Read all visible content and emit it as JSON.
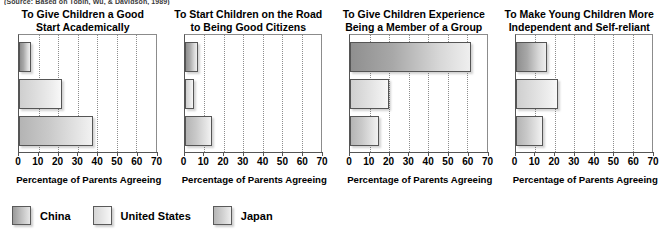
{
  "source_note": "(Source: Based on Tobin, Wu, & Davidson, 1989)",
  "legend": {
    "position": "bottom-left",
    "items": [
      {
        "label": "China",
        "key": "china"
      },
      {
        "label": "United States",
        "key": "us"
      },
      {
        "label": "Japan",
        "key": "japan"
      }
    ]
  },
  "axis": {
    "title": "Percentage of Parents Agreeing",
    "ticks": [
      0,
      10,
      20,
      30,
      40,
      50,
      60,
      70
    ],
    "min": 0,
    "max": 70
  },
  "chart_data": [
    {
      "type": "bar",
      "orientation": "horizontal",
      "title": "To Give Children a Good Start Academically",
      "title_lines": [
        "To Give Children a Good",
        "Start Academically"
      ],
      "categories": [
        "China",
        "United States",
        "Japan"
      ],
      "values": [
        6,
        22,
        38
      ],
      "xlabel": "Percentage of Parents Agreeing",
      "ylabel": "",
      "xlim": [
        0,
        70
      ],
      "grid": true
    },
    {
      "type": "bar",
      "orientation": "horizontal",
      "title": "To Start Children on the Road to Being Good Citizens",
      "title_lines": [
        "To Start Children on the Road",
        "to Being Good Citizens"
      ],
      "categories": [
        "China",
        "United States",
        "Japan"
      ],
      "values": [
        7,
        5,
        14
      ],
      "xlabel": "Percentage of Parents Agreeing",
      "ylabel": "",
      "xlim": [
        0,
        70
      ],
      "grid": true
    },
    {
      "type": "bar",
      "orientation": "horizontal",
      "title": "To Give Children Experience Being a Member of a Group",
      "title_lines": [
        "To Give Children Experience",
        "Being a Member of a Group"
      ],
      "categories": [
        "China",
        "United States",
        "Japan"
      ],
      "values": [
        62,
        20,
        15
      ],
      "xlabel": "Percentage of Parents Agreeing",
      "ylabel": "",
      "xlim": [
        0,
        70
      ],
      "grid": true
    },
    {
      "type": "bar",
      "orientation": "horizontal",
      "title": "To Make Young Children More Independent and Self-reliant",
      "title_lines": [
        "To Make Young Children More",
        "Independent and Self-reliant"
      ],
      "categories": [
        "China",
        "United States",
        "Japan"
      ],
      "values": [
        16,
        22,
        14
      ],
      "xlabel": "Percentage of Parents Agreeing",
      "ylabel": "",
      "xlim": [
        0,
        70
      ],
      "grid": true
    }
  ]
}
